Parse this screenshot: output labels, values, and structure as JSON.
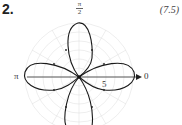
{
  "problem": {
    "number": "2.",
    "equation_ref": "(7.5)"
  },
  "labels": {
    "pi_half_num": "π",
    "pi_half_den": "2",
    "pi": "π",
    "zero": "0",
    "radius_tick": "5"
  },
  "colors": {
    "curve": "#1a1a1a",
    "grid": "#d8d8d8",
    "axis": "#333333"
  },
  "diagram": {
    "type": "polar rose curve",
    "petals": 4,
    "petal_directions": [
      "0",
      "π/2",
      "π",
      "3π/2"
    ]
  }
}
